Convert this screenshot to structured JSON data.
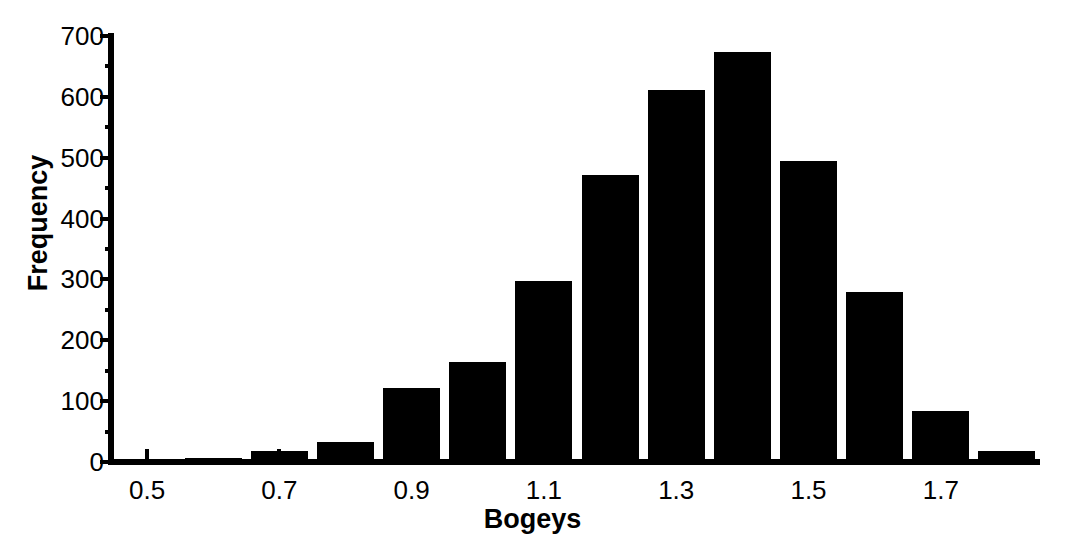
{
  "chart_data": {
    "type": "bar",
    "title": "",
    "subtitle": "",
    "xlabel": "Bogeys",
    "ylabel": "Frequency",
    "grid": false,
    "legend": false,
    "legend_position": "none",
    "bar_color": "#000000",
    "background_color": "#ffffff",
    "xlim": [
      0.45,
      1.85
    ],
    "ylim": [
      0,
      700
    ],
    "ytick_major_step": 100,
    "ytick_minor_step": 50,
    "yticks": [
      0,
      100,
      200,
      300,
      400,
      500,
      600,
      700
    ],
    "ytick_labels": [
      "0",
      "100",
      "200",
      "300",
      "400",
      "500",
      "600",
      "700"
    ],
    "xticks": [
      0.5,
      0.7,
      0.9,
      1.1,
      1.3,
      1.5,
      1.7
    ],
    "xtick_labels": [
      "0.5",
      "0.7",
      "0.9",
      "1.1",
      "1.3",
      "1.5",
      "1.7"
    ],
    "bin_width": 0.1,
    "bin_edges": [
      0.45,
      0.55,
      0.65,
      0.75,
      0.85,
      0.95,
      1.05,
      1.15,
      1.25,
      1.35,
      1.45,
      1.55,
      1.65,
      1.75,
      1.85
    ],
    "bin_centers": [
      0.5,
      0.6,
      0.7,
      0.8,
      0.9,
      1.0,
      1.1,
      1.2,
      1.3,
      1.4,
      1.5,
      1.6,
      1.7,
      1.8
    ],
    "categories": [
      "0.5",
      "0.6",
      "0.7",
      "0.8",
      "0.9",
      "1.0",
      "1.1",
      "1.2",
      "1.3",
      "1.4",
      "1.5",
      "1.6",
      "1.7",
      "1.8"
    ],
    "values": [
      2,
      6,
      18,
      33,
      122,
      165,
      298,
      472,
      611,
      673,
      495,
      280,
      84,
      18
    ]
  }
}
